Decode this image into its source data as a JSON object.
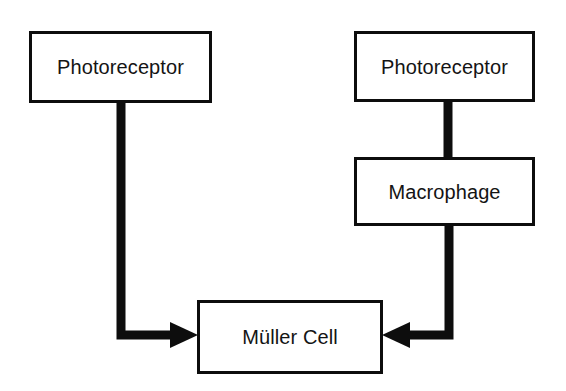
{
  "diagram": {
    "type": "flowchart",
    "background_color": "#ffffff",
    "stroke_color": "#0d0d0d",
    "text_color": "#141414",
    "nodes": [
      {
        "id": "photoreceptor-left",
        "label": "Photoreceptor",
        "shape": "rectangle",
        "x": 29,
        "y": 31,
        "width": 183,
        "height": 72
      },
      {
        "id": "photoreceptor-right",
        "label": "Photoreceptor",
        "shape": "rectangle",
        "x": 354,
        "y": 31,
        "width": 181,
        "height": 71
      },
      {
        "id": "macrophage",
        "label": "Macrophage",
        "shape": "rectangle",
        "x": 354,
        "y": 157,
        "width": 181,
        "height": 69
      },
      {
        "id": "muller-cell",
        "label": "Müller Cell",
        "shape": "rectangle",
        "x": 197,
        "y": 300,
        "width": 186,
        "height": 74
      }
    ],
    "edges": [
      {
        "id": "edge-photoreceptor-left-to-muller-cell",
        "from": "photoreceptor-left",
        "to": "muller-cell",
        "arrowhead": "end",
        "direction": "down-then-right"
      },
      {
        "id": "edge-photoreceptor-right-to-macrophage",
        "from": "photoreceptor-right",
        "to": "macrophage",
        "arrowhead": "none",
        "direction": "down"
      },
      {
        "id": "edge-macrophage-to-muller-cell",
        "from": "macrophage",
        "to": "muller-cell",
        "arrowhead": "end",
        "direction": "down-then-left"
      }
    ]
  }
}
